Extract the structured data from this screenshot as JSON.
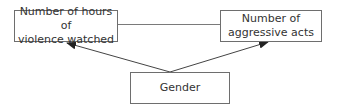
{
  "diagram": {
    "nodes": [
      {
        "id": "hours",
        "label": "Number of hours of violence watched",
        "lines": [
          "Number of hours of",
          "violence watched"
        ]
      },
      {
        "id": "aggr",
        "label": "Number of aggressive acts",
        "lines": [
          "Number of",
          "aggressive acts"
        ]
      },
      {
        "id": "gender",
        "label": "Gender",
        "lines": [
          "Gender"
        ]
      }
    ],
    "edges": [
      {
        "from": "hours",
        "to": "aggr",
        "type": "line",
        "directed": false
      },
      {
        "from": "gender",
        "to": "hours",
        "type": "arrow",
        "directed": true
      },
      {
        "from": "gender",
        "to": "aggr",
        "type": "arrow",
        "directed": true
      }
    ],
    "colors": {
      "stroke": "#6e6e6e",
      "arrow": "#333333",
      "text": "#333333",
      "background": "#ffffff"
    }
  }
}
